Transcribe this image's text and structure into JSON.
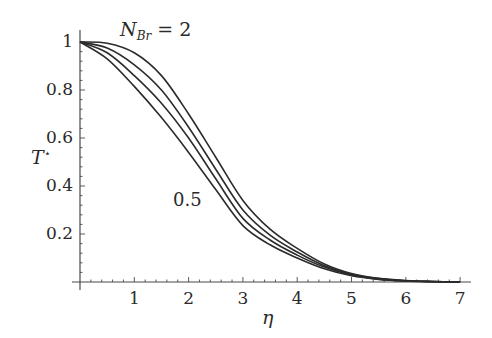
{
  "chart_data": {
    "type": "line",
    "title": "",
    "xlabel": "η",
    "ylabel": "T*",
    "xlim": [
      0,
      7.2
    ],
    "ylim": [
      0,
      1.05
    ],
    "x_ticks": [
      1,
      2,
      3,
      4,
      5,
      6,
      7
    ],
    "y_ticks": [
      0.2,
      0.4,
      0.6,
      0.8,
      1
    ],
    "x_tick_labels": [
      "1",
      "2",
      "3",
      "4",
      "5",
      "6",
      "7"
    ],
    "y_tick_labels": [
      "0.2",
      "0.4",
      "0.6",
      "0.8",
      "1"
    ],
    "grid": false,
    "legend": "none",
    "annotations": [
      {
        "text": "N_Br = 2",
        "display_main": "N",
        "display_sub": "Br",
        "display_rest": " = 2",
        "points_to": "top curve"
      },
      {
        "text": "0.5",
        "points_to": "bottom curve"
      }
    ],
    "x": [
      0,
      0.5,
      1,
      1.5,
      2,
      2.5,
      3,
      3.5,
      4,
      4.5,
      5,
      5.5,
      6,
      6.5,
      7
    ],
    "series": [
      {
        "name": "N_Br = 2",
        "values": [
          1.0,
          0.995,
          0.955,
          0.86,
          0.7,
          0.52,
          0.34,
          0.22,
          0.14,
          0.075,
          0.035,
          0.015,
          0.006,
          0.002,
          0.0
        ]
      },
      {
        "name": "N_Br = 1.5",
        "values": [
          1.0,
          0.975,
          0.905,
          0.8,
          0.645,
          0.47,
          0.3,
          0.195,
          0.125,
          0.068,
          0.032,
          0.014,
          0.005,
          0.002,
          0.0
        ]
      },
      {
        "name": "N_Br = 1",
        "values": [
          1.0,
          0.955,
          0.86,
          0.745,
          0.6,
          0.43,
          0.265,
          0.175,
          0.112,
          0.062,
          0.029,
          0.012,
          0.005,
          0.002,
          0.0
        ]
      },
      {
        "name": "N_Br = 0.5",
        "values": [
          1.0,
          0.93,
          0.815,
          0.685,
          0.54,
          0.385,
          0.235,
          0.155,
          0.1,
          0.055,
          0.026,
          0.011,
          0.004,
          0.001,
          0.0
        ]
      }
    ]
  },
  "axes": {
    "x_label": "η",
    "y_label_main": "T",
    "y_label_sup": "⋆"
  }
}
